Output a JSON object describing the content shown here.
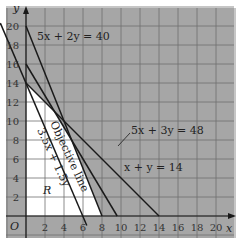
{
  "chart_data": {
    "type": "line",
    "title": "",
    "xlabel": "x",
    "ylabel": "y",
    "origin_label": "O",
    "xlim": [
      -2,
      21
    ],
    "ylim": [
      -2,
      21
    ],
    "grid": true,
    "x_ticks": [
      "2",
      "4",
      "6",
      "8",
      "10",
      "12",
      "14",
      "16",
      "18",
      "20"
    ],
    "y_ticks": [
      "2",
      "4",
      "6",
      "8",
      "10",
      "12",
      "14",
      "16",
      "18",
      "20"
    ],
    "series": [
      {
        "name": "5x + 2y = 40",
        "points": [
          [
            0,
            20
          ],
          [
            8,
            0
          ]
        ]
      },
      {
        "name": "5x + 3y = 48",
        "points": [
          [
            0,
            16
          ],
          [
            9.6,
            0
          ]
        ]
      },
      {
        "name": "x + y = 14",
        "points": [
          [
            0,
            14
          ],
          [
            14,
            0
          ]
        ]
      },
      {
        "name": "Objective line 3.5x + 1.5y",
        "points": [
          [
            -2.7,
            20.3
          ],
          [
            6.4,
            -1
          ]
        ]
      }
    ],
    "feasible_region": {
      "label": "R",
      "vertices": [
        [
          0,
          0
        ],
        [
          0,
          14
        ],
        [
          3,
          11
        ],
        [
          4.8,
          8
        ],
        [
          8,
          0
        ]
      ]
    },
    "annotations": {
      "eq1": "5x + 2y = 40",
      "eq2": "5x + 3y = 48",
      "eq3": "x + y = 14",
      "objective_title": "Objective line",
      "objective_expr": "3.5x + 1.5y",
      "region": "R"
    },
    "colors": {
      "shade": "#a6a6a6",
      "grid": "#6e6e6e",
      "line": "#1a1a1a",
      "region": "#ffffff"
    }
  }
}
